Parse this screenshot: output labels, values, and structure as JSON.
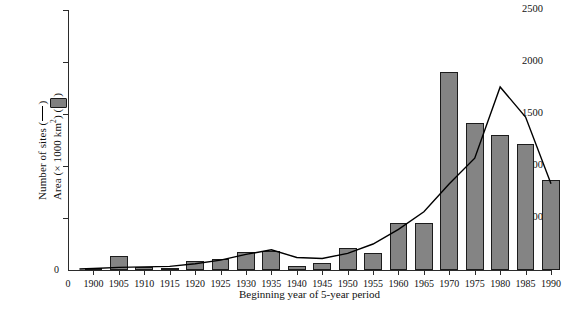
{
  "chart_data": {
    "type": "bar",
    "title": "",
    "subtitle": "",
    "xlabel": "Beginning year of 5-year period",
    "ylabel_line1": "Number of sites (—)",
    "ylabel_line2": "Area (× 1000 km²) (■)",
    "ylabel_line2_prefix": "Area (× 1000 km",
    "ylabel_line2_sup": "2",
    "ylabel_line2_suffix": ") (",
    "ylabel_line2_end": ")",
    "ylabel_line1_prefix": "Number of sites (",
    "ylabel_line1_end": ")",
    "categories": [
      "1900",
      "1905",
      "1910",
      "1915",
      "1920",
      "1925",
      "1930",
      "1935",
      "1940",
      "1945",
      "1950",
      "1955",
      "1960",
      "1965",
      "1970",
      "1975",
      "1980",
      "1985",
      "1990"
    ],
    "x_tick_labels": [
      "0",
      "1900",
      "1905",
      "1910",
      "1915",
      "1920",
      "1925",
      "1930",
      "1935",
      "1940",
      "1945",
      "1950",
      "1955",
      "1960",
      "1965",
      "1970",
      "1975",
      "1980",
      "1985",
      "1990"
    ],
    "y_tick_labels": [
      "0",
      "500",
      "1000",
      "1500",
      "2000",
      "2500"
    ],
    "y_tick_values": [
      0,
      500,
      1000,
      1500,
      2000,
      2500
    ],
    "ylim": [
      0,
      2500
    ],
    "grid": false,
    "legend_position": "y-axis-label",
    "series": [
      {
        "name": "Area (× 1000 km²)",
        "type": "bar",
        "color": "#848484",
        "edge_color": "#1c1c1c",
        "values": [
          20,
          130,
          25,
          20,
          90,
          105,
          175,
          185,
          40,
          65,
          210,
          165,
          450,
          450,
          1900,
          1410,
          1300,
          1210,
          870
        ]
      },
      {
        "name": "Number of sites",
        "type": "line",
        "color": "#000000",
        "values": [
          15,
          25,
          30,
          35,
          60,
          95,
          150,
          195,
          120,
          110,
          160,
          250,
          390,
          560,
          830,
          1075,
          1760,
          1470,
          830
        ]
      }
    ]
  },
  "axes": {
    "y_max": 2500,
    "y_min": 0
  }
}
